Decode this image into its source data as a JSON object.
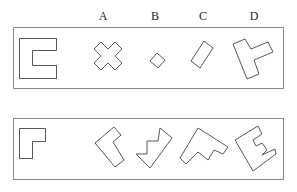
{
  "option_labels": [
    "A",
    "B",
    "C",
    "D"
  ],
  "rows": [
    {
      "reference": "C-shape (bracket open to the right)",
      "options": [
        {
          "label": "A",
          "shape": "plus-cross"
        },
        {
          "label": "B",
          "shape": "small-square"
        },
        {
          "label": "C",
          "shape": "rectangle"
        },
        {
          "label": "D",
          "shape": "T-shape"
        }
      ]
    },
    {
      "reference": "L-shape",
      "options": [
        {
          "label": "A",
          "shape": "L-shape rotated"
        },
        {
          "label": "B",
          "shape": "zigzag"
        },
        {
          "label": "C",
          "shape": "stepped shape"
        },
        {
          "label": "D",
          "shape": "E-shape"
        }
      ]
    }
  ]
}
